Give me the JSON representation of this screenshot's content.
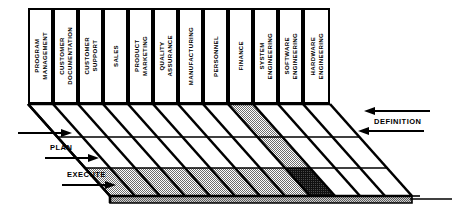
{
  "diagram": {
    "columns": [
      {
        "id": "program-management",
        "label": "PROGRAM\nMANAGEMENT"
      },
      {
        "id": "customer-documentation",
        "label": "CUSTOMER\nDOCUMENTATION"
      },
      {
        "id": "customer-support",
        "label": "CUSTOMER\nSUPPORT"
      },
      {
        "id": "sales",
        "label": "SALES"
      },
      {
        "id": "product-marketing",
        "label": "PRODUCT\nMARKETING"
      },
      {
        "id": "quality-assurance",
        "label": "QUALITY\nASSURANCE"
      },
      {
        "id": "manufacturing",
        "label": "MANUFACTURING"
      },
      {
        "id": "personnel",
        "label": "PERSONNEL"
      },
      {
        "id": "finance",
        "label": "FINANCE"
      },
      {
        "id": "system-engineering",
        "label": "SYSTEM\nENGINEERING"
      },
      {
        "id": "software-engineering",
        "label": "SOFTWARE\nENGINEERING"
      },
      {
        "id": "hardware-engineering",
        "label": "HARDWARE\nENGINEERING"
      }
    ],
    "phases": [
      {
        "id": "definition",
        "label": "DEFINITION"
      },
      {
        "id": "plan",
        "label": "PLAN"
      },
      {
        "id": "execute",
        "label": "EXECUTE"
      }
    ],
    "shading": {
      "rows": [
        {
          "phase": "definition",
          "cells": [
            {
              "col": 9,
              "fill": "gray"
            }
          ]
        },
        {
          "phase": "plan",
          "cells": [
            {
              "col": 9,
              "fill": "gray"
            }
          ]
        },
        {
          "phase": "execute",
          "cells": [
            {
              "col": 1,
              "fill": "gray"
            },
            {
              "col": 2,
              "fill": "gray"
            },
            {
              "col": 3,
              "fill": "gray"
            },
            {
              "col": 4,
              "fill": "gray"
            },
            {
              "col": 5,
              "fill": "gray"
            },
            {
              "col": 6,
              "fill": "gray"
            },
            {
              "col": 7,
              "fill": "gray"
            },
            {
              "col": 8,
              "fill": "gray"
            },
            {
              "col": 9,
              "fill": "black"
            }
          ]
        }
      ]
    },
    "colors": {
      "line": "#000000",
      "plane": "#ffffff",
      "gray_fill": "#a8a8a8",
      "black_fill": "#1a1a1a",
      "edge_fill": "#8f8f8f",
      "background": "#ffffff"
    }
  }
}
